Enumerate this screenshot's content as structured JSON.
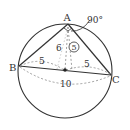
{
  "diagram": {
    "type": "geometry",
    "points": {
      "A": {
        "label": "A"
      },
      "B": {
        "label": "B"
      },
      "C": {
        "label": "C"
      },
      "O": {
        "label": ""
      }
    },
    "labels": {
      "angle_A": "90°",
      "height_AO": "6",
      "radius_AO": "5",
      "segment_BO": "5",
      "segment_OC": "5",
      "segment_BC": "10"
    },
    "colors": {
      "stroke": "#333333",
      "dashed": "#888888",
      "background": "#ffffff"
    }
  }
}
